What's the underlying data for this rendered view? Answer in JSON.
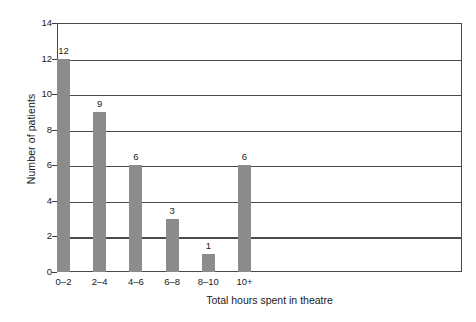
{
  "chart_data": {
    "type": "bar",
    "title": "",
    "subtitle": "",
    "xlabel": "Total hours spent in theatre",
    "ylabel": "Number of patients",
    "categories": [
      "0–2",
      "2–4",
      "4–6",
      "6–8",
      "8–10",
      "10+"
    ],
    "values": [
      12,
      9,
      6,
      3,
      1,
      6
    ],
    "data_labels": [
      "12",
      "9",
      "6",
      "3",
      "1",
      "6"
    ],
    "ylim": [
      0,
      14
    ],
    "y_ticks": [
      0,
      2,
      4,
      6,
      8,
      10,
      12,
      14
    ],
    "y_tick_labels": [
      "0",
      "2",
      "4",
      "6",
      "8",
      "10",
      "12",
      "14"
    ],
    "grid": "horizontal",
    "legend": "none",
    "series": [
      {
        "name": "Number of patients",
        "values": [
          12,
          9,
          6,
          3,
          1,
          6
        ],
        "color": "#8c8c8c"
      }
    ],
    "colors": {
      "bar_fill": "#8c8c8c",
      "gridline": "#4a4a4a",
      "axis_line": "#4a4a4a",
      "text": "#1a1a1a",
      "background": "#ffffff"
    }
  },
  "caption": {
    "clipped_text": " "
  }
}
